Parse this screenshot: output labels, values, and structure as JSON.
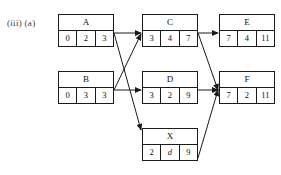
{
  "figure": {
    "label": "(iii) (a)",
    "type": "activity-on-node-network-diagram",
    "stroke_color": "#1a1a1a",
    "background_color": "#ffffff"
  },
  "nodes": [
    {
      "id": "A",
      "name": "A",
      "cells": [
        "0",
        "2",
        "3"
      ],
      "italic_cells": [],
      "x": 58,
      "y": 14
    },
    {
      "id": "B",
      "name": "B",
      "cells": [
        "0",
        "3",
        "3"
      ],
      "italic_cells": [],
      "x": 58,
      "y": 71
    },
    {
      "id": "C",
      "name": "C",
      "cells": [
        "3",
        "4",
        "7"
      ],
      "italic_cells": [],
      "x": 142,
      "y": 14
    },
    {
      "id": "D",
      "name": "D",
      "cells": [
        "3",
        "2",
        "9"
      ],
      "italic_cells": [],
      "x": 142,
      "y": 71
    },
    {
      "id": "X",
      "name": "X",
      "cells": [
        "2",
        "d",
        "9"
      ],
      "italic_cells": [
        1
      ],
      "x": 142,
      "y": 128
    },
    {
      "id": "E",
      "name": "E",
      "cells": [
        "7",
        "4",
        "11"
      ],
      "italic_cells": [],
      "x": 219,
      "y": 14
    },
    {
      "id": "F",
      "name": "F",
      "cells": [
        "7",
        "2",
        "11"
      ],
      "italic_cells": [],
      "x": 219,
      "y": 71
    }
  ],
  "edges": [
    {
      "id": "A-C",
      "from": "A",
      "to": "C",
      "x1": 114,
      "y1": 33,
      "x2": 141,
      "y2": 33
    },
    {
      "id": "A-X",
      "from": "A",
      "to": "X",
      "x1": 114,
      "y1": 33,
      "x2": 141,
      "y2": 130
    },
    {
      "id": "B-C",
      "from": "B",
      "to": "C",
      "x1": 114,
      "y1": 90,
      "x2": 141,
      "y2": 34
    },
    {
      "id": "B-D",
      "from": "B",
      "to": "D",
      "x1": 114,
      "y1": 90,
      "x2": 141,
      "y2": 90
    },
    {
      "id": "C-E",
      "from": "C",
      "to": "E",
      "x1": 198,
      "y1": 33,
      "x2": 218,
      "y2": 33
    },
    {
      "id": "C-F",
      "from": "C",
      "to": "F",
      "x1": 198,
      "y1": 33,
      "x2": 218,
      "y2": 90
    },
    {
      "id": "D-F",
      "from": "D",
      "to": "F",
      "x1": 198,
      "y1": 90,
      "x2": 218,
      "y2": 90
    },
    {
      "id": "X-F",
      "from": "X",
      "to": "F",
      "x1": 198,
      "y1": 158,
      "x2": 218,
      "y2": 90
    }
  ]
}
